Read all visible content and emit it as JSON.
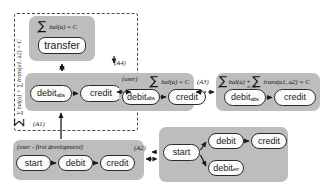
{
  "diagram": {
    "type": "refinement-state-machine-diagram",
    "background": "#ffffff",
    "group_fill": "#bdbdbd",
    "node_fill": "#fbfbfb",
    "stroke": "#2b2b2b"
  },
  "scope": {
    "invariant_label": "∑ bal(a) + ∑ trans(a1, a2) = C",
    "invariant_sum1_index": "a",
    "invariant_sum2_index": "a1,a2"
  },
  "groups": {
    "transfer_group": {
      "name": "transfer-group",
      "formula": "bal(a) = C",
      "sum_index": "a",
      "nodes": [
        {
          "label": "transfer"
        }
      ]
    },
    "abs_group": {
      "name": "debit-abs-credit-group",
      "nodes": [
        {
          "label": "debit",
          "sub": "abs"
        },
        {
          "label": "credit"
        }
      ]
    },
    "user_group": {
      "name": "user-balance-group",
      "tag": "(user)",
      "formula": "bal(a) = C",
      "sum_index": "a",
      "nodes": [
        {
          "label": "debit",
          "sub": "abs"
        },
        {
          "label": "credit"
        }
      ]
    },
    "trans_group": {
      "name": "balance-plus-transfer-group",
      "formula_part1": "bal(a) +",
      "formula_part2": "trans(a1, a2) = C",
      "sum1_index": "a",
      "sum2_index": "a1,a2",
      "nodes": [
        {
          "label": "debit",
          "sub": "abs"
        },
        {
          "label": "credit"
        }
      ]
    },
    "first_dev_group": {
      "name": "first-development-group",
      "tag": "(user - first development)",
      "nodes": [
        {
          "label": "start"
        },
        {
          "label": "debit"
        },
        {
          "label": "credit"
        }
      ]
    },
    "error_group": {
      "name": "error-branch-group",
      "nodes": [
        {
          "label": "start"
        },
        {
          "label": "debit"
        },
        {
          "label": "credit"
        },
        {
          "label": "debit",
          "sub": "err"
        }
      ]
    }
  },
  "refinement_labels": {
    "a1": "(A1)",
    "a2": "(A2)",
    "a3": "(A3)",
    "a4": "(A4)"
  },
  "symbols": {
    "sum": "∑"
  }
}
